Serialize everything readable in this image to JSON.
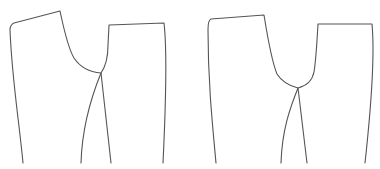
{
  "diagram": {
    "type": "sewing-pattern-outline",
    "stroke_color": "#555555",
    "background": "#ffffff",
    "figures": [
      {
        "id": "pattern-left",
        "pieces": [
          {
            "name": "front-piece",
            "path": "M23,163 C19,120 12,80 10,30 Q10,25 14,23 L60,11 C64,30 68,48 74,58 C80,67 88,72 101,73 L111,163"
          },
          {
            "name": "back-piece",
            "path": "M81,163 C82,130 90,100 101,73 C106,66 108,58 108,45 L109,25 L164,23 C166,40 167,80 163,163"
          }
        ]
      },
      {
        "id": "pattern-right",
        "pieces": [
          {
            "name": "front-piece",
            "path": "M216,163 C212,120 208,80 208,30 Q208,20 211,19 L264,15 C268,40 272,62 277,74 C282,82 290,86 298,88 L307,163"
          },
          {
            "name": "back-piece",
            "path": "M281,163 C282,130 290,108 298,88 C306,86 312,82 314,72 C316,60 317,42 318,24 L372,24 C374,45 373,90 365,163"
          }
        ]
      }
    ]
  }
}
